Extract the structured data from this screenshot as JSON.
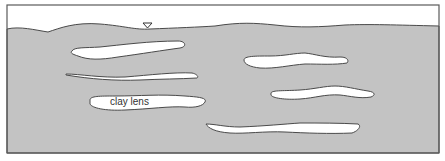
{
  "diagram": {
    "colors": {
      "saturated_zone": "#c3c3c3",
      "clay_lens": "#ffffff",
      "outline": "#4a4a4a",
      "background": "#ffffff"
    },
    "water_table_marker": {
      "symbol": "inverted-triangle",
      "x": 147,
      "y": 25
    },
    "labels": {
      "clay_lens": "clay lens"
    },
    "lens_count": 6
  }
}
